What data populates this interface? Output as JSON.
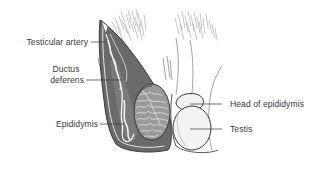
{
  "diagram": {
    "colors": {
      "background": "#ffffff",
      "outline": "#4a4a4a",
      "scrotal_wall_fill": "#6e6e6e",
      "testis_fill": "#efefef",
      "epididymis_fill": "#8a8a8a",
      "hair_stroke": "#9a9a9a",
      "label_text": "#3a3a3a",
      "leader_line": "#3a3a3a"
    },
    "labels": [
      {
        "id": "testicular-artery",
        "text": "Testicular artery",
        "side": "left"
      },
      {
        "id": "ductus-deferens",
        "line1": "Ductus",
        "line2": "deferens",
        "side": "left"
      },
      {
        "id": "epididymis",
        "text": "Epididymis",
        "side": "left"
      },
      {
        "id": "head-of-epididymis",
        "text": "Head of epididymis",
        "side": "right"
      },
      {
        "id": "testis",
        "text": "Testis",
        "side": "right"
      }
    ]
  }
}
